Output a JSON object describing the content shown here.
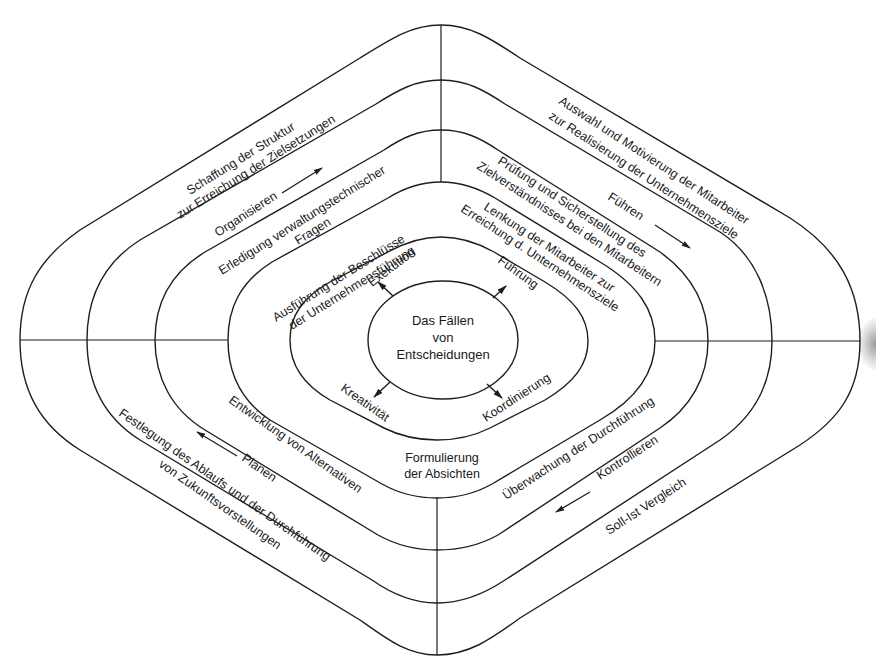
{
  "header_fragment": "Management Regelkreis",
  "center": {
    "line1": "Das Fällen",
    "line2": "von",
    "line3": "Entscheidungen"
  },
  "inner_ring": {
    "top_left": "Exekution",
    "top_right": "Führung",
    "bottom_left": "Kreativität",
    "bottom_right": "Koordinierung"
  },
  "ring_tasks": {
    "top_left_1": "Ausführung der Beschlüsse",
    "top_left_2": "der Unternehmensführung",
    "top_right_1": "Lenkung der Mitarbeiter zur",
    "top_right_2": "Erreichung d. Unternehmensziele",
    "bottom_center_1": "Formulierung",
    "bottom_center_2": "der Absichten"
  },
  "ring_detail": {
    "top_left_1": "Erledigung verwaltungstechnischer",
    "top_left_2": "Fragen",
    "top_right_1": "Prüfung und Sicherstellung des",
    "top_right_2": "Zielverständnisses bei den Mitarbeitern",
    "bottom_left": "Entwicklung von Alternativen",
    "bottom_right": "Überwachung der Durchführung"
  },
  "functions": {
    "top_left": "Organisieren",
    "top_right": "Führen",
    "bottom_left": "Planen",
    "bottom_right": "Kontrollieren"
  },
  "outer_ring": {
    "top_left_1": "Schaffung der Struktur",
    "top_left_2": "zur Erreichung der Zielsetzungen",
    "top_right_1": "Auswahl und Motivierung der Mitarbeiter",
    "top_right_2": "zur Realisierung der Unternehmensziele",
    "bottom_left_1": "Festlegung des Ablaufs und der Durchführung",
    "bottom_left_2": "von Zukunftsvorstellungen",
    "bottom_right": "Soll-Ist Vergleich"
  },
  "colors": {
    "line": "#1e1e1e",
    "text": "#1a1a1a",
    "background": "#ffffff"
  }
}
